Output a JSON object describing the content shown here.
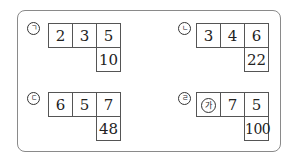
{
  "panels": [
    {
      "id": "a",
      "marker": "ㄱ",
      "top_row": [
        "2",
        "3",
        "5"
      ],
      "result": "10"
    },
    {
      "id": "b",
      "marker": "ㄴ",
      "top_row": [
        "3",
        "4",
        "6"
      ],
      "result": "22"
    },
    {
      "id": "c",
      "marker": "ㄷ",
      "top_row": [
        "6",
        "5",
        "7"
      ],
      "result": "48"
    },
    {
      "id": "d",
      "marker": "ㄹ",
      "top_row": [
        "가",
        "7",
        "5"
      ],
      "result": "100",
      "unknown_cell_index": 0
    }
  ]
}
